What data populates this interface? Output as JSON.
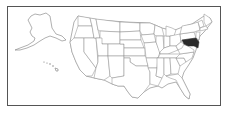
{
  "map": {
    "title": "",
    "region": "United States",
    "highlighted_states": [
      "Maryland",
      "Delaware"
    ],
    "colors": {
      "highlight": "#2a2a2a",
      "state_fill": "#ffffff",
      "state_border": "#8a8a8a",
      "frame_border": "#555555"
    },
    "insets": [
      "Alaska",
      "Hawaii"
    ]
  }
}
